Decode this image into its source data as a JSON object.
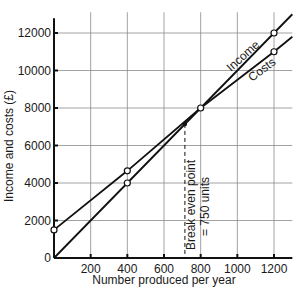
{
  "chart_data": {
    "type": "line",
    "title": "",
    "xlabel": "Number produced per year",
    "ylabel": "Income and costs (£)",
    "xlim": [
      0,
      1300
    ],
    "ylim": [
      0,
      13000
    ],
    "grid": true,
    "x_ticks": [
      0,
      200,
      400,
      600,
      800,
      1000,
      1200
    ],
    "x_tick_labels": [
      "",
      "200",
      "400",
      "600",
      "800",
      "1000",
      "1200"
    ],
    "y_ticks": [
      0,
      2000,
      4000,
      6000,
      8000,
      10000,
      12000
    ],
    "y_tick_labels": [
      "0",
      "2000",
      "4000",
      "6000",
      "8000",
      "10000",
      "12000"
    ],
    "series": [
      {
        "name": "Income",
        "x": [
          0,
          400,
          800,
          1200,
          1300
        ],
        "values": [
          0,
          4000,
          8000,
          12000,
          13000
        ],
        "markers_at": [
          400,
          1200
        ]
      },
      {
        "name": "Costs",
        "x": [
          0,
          400,
          800,
          1200,
          1300
        ],
        "values": [
          1500,
          4650,
          8000,
          11000,
          11800
        ],
        "markers_at": [
          0,
          400,
          800,
          1200
        ]
      }
    ],
    "annotations": [
      {
        "text": "Break even point",
        "text2": "= 750 units",
        "x": 714,
        "y": 7150,
        "style": "dashed vertical line"
      }
    ],
    "legend": "inline labels on lines"
  }
}
